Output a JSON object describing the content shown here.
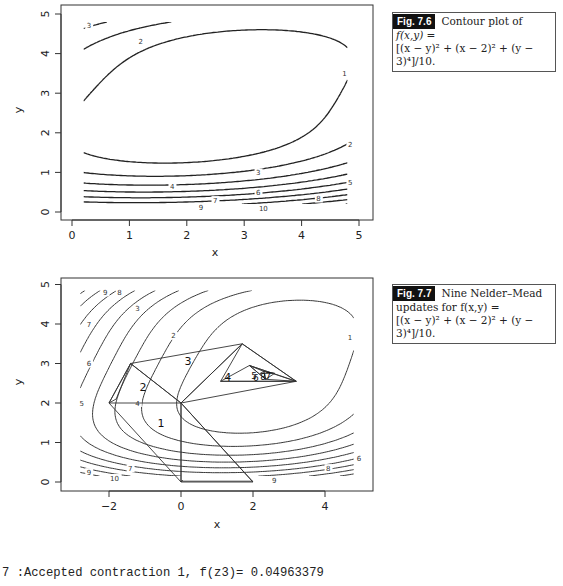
{
  "figures": [
    {
      "tag": "Fig. 7.6",
      "caption_title": "Contour plot of",
      "caption_line2": "f(x,y) =",
      "caption_line3": "[(x − y)² + (x − 2)² + (y − 3)⁴]/10."
    },
    {
      "tag": "Fig. 7.7",
      "caption_title": "Nine Nelder–Mead",
      "caption_line2": "updates for f(x,y) =",
      "caption_line3": "[(x − y)² + (x − 2)² + (y − 3)⁴]/10."
    }
  ],
  "console_line": "7 :Accepted contraction 1, f(z3)= 0.04963379",
  "chart_data": [
    {
      "type": "contour",
      "title": "",
      "function": "((x-y)^2 + (x-2)^2 + (y-3)^4)/10",
      "xlabel": "x",
      "ylabel": "y",
      "xlim": [
        0,
        5
      ],
      "ylim": [
        0,
        5
      ],
      "xticks": [
        0,
        1,
        2,
        3,
        4,
        5
      ],
      "yticks": [
        0,
        1,
        2,
        3,
        4,
        5
      ],
      "levels": [
        1,
        2,
        3,
        4,
        5,
        6,
        7,
        8,
        9,
        10
      ],
      "contour_labels": [
        {
          "text": "3",
          "x": 0.3,
          "y": 4.7
        },
        {
          "text": "2",
          "x": 1.2,
          "y": 4.3
        },
        {
          "text": "1",
          "x": 4.75,
          "y": 3.5
        },
        {
          "text": "2",
          "x": 4.85,
          "y": 1.7
        },
        {
          "text": "3",
          "x": 3.25,
          "y": 1.0
        },
        {
          "text": "4",
          "x": 1.75,
          "y": 0.65
        },
        {
          "text": "5",
          "x": 4.85,
          "y": 0.75
        },
        {
          "text": "6",
          "x": 3.25,
          "y": 0.48
        },
        {
          "text": "7",
          "x": 2.5,
          "y": 0.3
        },
        {
          "text": "8",
          "x": 4.3,
          "y": 0.34
        },
        {
          "text": "9",
          "x": 2.25,
          "y": 0.12
        },
        {
          "text": "10",
          "x": 3.3,
          "y": 0.1
        }
      ],
      "grid": false
    },
    {
      "type": "contour",
      "title": "",
      "function": "((x-y)^2 + (x-2)^2 + (y-3)^4)/10",
      "xlabel": "x",
      "ylabel": "y",
      "xlim": [
        -3,
        5
      ],
      "ylim": [
        0,
        5
      ],
      "xticks": [
        -2,
        0,
        2,
        4
      ],
      "yticks": [
        0,
        1,
        2,
        3,
        4,
        5
      ],
      "levels": [
        1,
        2,
        3,
        4,
        5,
        6,
        7,
        8,
        9,
        10
      ],
      "contour_labels": [
        {
          "text": "9",
          "x": -2.1,
          "y": 4.8
        },
        {
          "text": "8",
          "x": -1.7,
          "y": 4.8
        },
        {
          "text": "7",
          "x": -2.55,
          "y": 4.0
        },
        {
          "text": "6",
          "x": -2.55,
          "y": 3.0
        },
        {
          "text": "5",
          "x": -2.75,
          "y": 2.0
        },
        {
          "text": "4",
          "x": -1.2,
          "y": 2.0
        },
        {
          "text": "3",
          "x": -1.2,
          "y": 4.4
        },
        {
          "text": "2",
          "x": -0.2,
          "y": 3.7
        },
        {
          "text": "1",
          "x": 4.7,
          "y": 3.65
        },
        {
          "text": "7",
          "x": -1.4,
          "y": 0.35
        },
        {
          "text": "9",
          "x": -2.55,
          "y": 0.25
        },
        {
          "text": "10",
          "x": -1.9,
          "y": 0.1
        },
        {
          "text": "6",
          "x": 4.95,
          "y": 0.6
        },
        {
          "text": "8",
          "x": 4.1,
          "y": 0.35
        },
        {
          "text": "9",
          "x": 2.6,
          "y": 0.05
        }
      ],
      "simplex_lines": [
        [
          [
            0,
            0
          ],
          [
            2,
            0
          ],
          [
            0,
            2
          ],
          [
            0,
            0
          ]
        ],
        [
          [
            -2,
            2
          ],
          [
            0,
            2
          ],
          [
            -1.4,
            3
          ],
          [
            -2,
            2
          ]
        ],
        [
          [
            0,
            2
          ],
          [
            -1.4,
            3
          ],
          [
            1.7,
            3.5
          ],
          [
            0,
            2
          ]
        ],
        [
          [
            0,
            2
          ],
          [
            1.7,
            3.5
          ],
          [
            3.2,
            2.55
          ],
          [
            0,
            2
          ]
        ],
        [
          [
            1.7,
            3.5
          ],
          [
            1.1,
            2.55
          ],
          [
            3.2,
            2.55
          ],
          [
            1.7,
            3.5
          ]
        ],
        [
          [
            1.1,
            2.55
          ],
          [
            3.2,
            2.55
          ],
          [
            1.9,
            2.95
          ],
          [
            1.1,
            2.55
          ]
        ],
        [
          [
            1.9,
            2.95
          ],
          [
            3.2,
            2.55
          ],
          [
            2.35,
            2.6
          ],
          [
            1.9,
            2.95
          ]
        ],
        [
          [
            1.9,
            2.95
          ],
          [
            2.3,
            2.8
          ],
          [
            2.35,
            2.6
          ],
          [
            1.9,
            2.95
          ]
        ],
        [
          [
            2.3,
            2.8
          ],
          [
            2.35,
            2.6
          ],
          [
            2.6,
            2.75
          ],
          [
            2.3,
            2.8
          ]
        ],
        [
          [
            2.3,
            2.8
          ],
          [
            2.6,
            2.75
          ],
          [
            2.2,
            2.75
          ],
          [
            2.3,
            2.8
          ]
        ],
        [
          [
            -2,
            2
          ],
          [
            -1.4,
            3
          ],
          [
            -1.8,
            2.1
          ],
          [
            -2,
            2
          ]
        ],
        [
          [
            -2,
            2
          ],
          [
            0,
            0
          ],
          [
            0.05,
            0.05
          ]
        ],
        [
          [
            0,
            2
          ],
          [
            0,
            0
          ]
        ],
        [
          [
            2,
            0
          ],
          [
            0,
            2
          ]
        ],
        [
          [
            0,
            0.02
          ],
          [
            2,
            0.02
          ]
        ]
      ],
      "simplex_labels": [
        {
          "text": "1",
          "x": -0.65,
          "y": 1.4
        },
        {
          "text": "2",
          "x": -1.15,
          "y": 2.3
        },
        {
          "text": "3",
          "x": 0.1,
          "y": 2.95
        },
        {
          "text": "4",
          "x": 1.2,
          "y": 2.55
        },
        {
          "text": "5",
          "x": 1.95,
          "y": 2.62
        },
        {
          "text": "6",
          "x": 2.0,
          "y": 2.55
        },
        {
          "text": "7",
          "x": 2.35,
          "y": 2.62
        },
        {
          "text": "8",
          "x": 2.2,
          "y": 2.58
        }
      ],
      "grid": false
    }
  ]
}
